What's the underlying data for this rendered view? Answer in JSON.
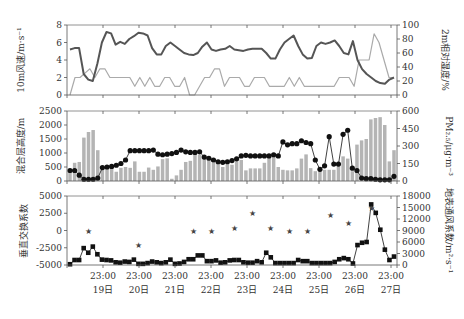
{
  "figure": {
    "caption": "",
    "x_ticks": [
      {
        "time": "23:00",
        "day": "19日"
      },
      {
        "time": "23:00",
        "day": "20日"
      },
      {
        "time": "23:00",
        "day": "21日"
      },
      {
        "time": "23:00",
        "day": "22日"
      },
      {
        "time": "23:00",
        "day": "23日"
      },
      {
        "time": "23:00",
        "day": "24日"
      },
      {
        "time": "23:00",
        "day": "25日"
      },
      {
        "time": "23:00",
        "day": "26日"
      },
      {
        "time": "23:00",
        "day": "27日"
      }
    ],
    "colors": {
      "dark_line": "#555555",
      "light_line": "#aaaaaa",
      "bars": "#b4b4b4",
      "markers": "#111111",
      "stars": "#444444"
    }
  },
  "chart_data": [
    {
      "type": "line",
      "panel": "top",
      "title": "",
      "ylabel": "10m风速/m·s⁻¹",
      "ylabel_right": "2m相对湿度/%",
      "ylim": [
        0,
        8
      ],
      "yticks": [
        0,
        2,
        4,
        6,
        8
      ],
      "ylim_right": [
        0,
        100
      ],
      "yticks_right": [
        0,
        20,
        40,
        60,
        80,
        100
      ],
      "x_interval_hours": 6,
      "series": [
        {
          "name": "10m风速",
          "axis": "left",
          "style": "light",
          "values": [
            0,
            2,
            2,
            2.5,
            3,
            2,
            3,
            3,
            2,
            2,
            2,
            2,
            2,
            1,
            2,
            1,
            2,
            1,
            1,
            2,
            2,
            1,
            1,
            2,
            0,
            0,
            1,
            2,
            2,
            3,
            3,
            1,
            2,
            2,
            2,
            1,
            1,
            2,
            2,
            2,
            1,
            1,
            1,
            1,
            2,
            1,
            2,
            1,
            1,
            1,
            1,
            1,
            1,
            1,
            2,
            2,
            2,
            1,
            4,
            4,
            4,
            7,
            6,
            4,
            2,
            2
          ]
        },
        {
          "name": "2m相对湿度",
          "axis": "right",
          "style": "dark",
          "values": [
            65,
            67,
            67,
            30,
            22,
            20,
            45,
            75,
            90,
            88,
            72,
            76,
            73,
            80,
            84,
            89,
            88,
            85,
            67,
            58,
            58,
            70,
            75,
            70,
            65,
            60,
            58,
            57,
            60,
            69,
            75,
            65,
            63,
            65,
            66,
            70,
            65,
            64,
            63,
            65,
            66,
            66,
            66,
            60,
            52,
            52,
            65,
            75,
            80,
            85,
            70,
            58,
            52,
            53,
            70,
            75,
            73,
            75,
            78,
            70,
            60,
            58,
            77,
            50,
            37,
            30,
            25,
            20,
            17,
            16,
            22,
            25
          ]
        }
      ]
    },
    {
      "type": "bar+line",
      "panel": "middle",
      "ylabel": "混合层高度/m",
      "ylabel_right": "PM₂.₅/μg·m⁻³",
      "ylim": [
        0,
        2500
      ],
      "yticks": [
        0,
        500,
        1000,
        1500,
        2000,
        2500
      ],
      "ylim_right": [
        0,
        600
      ],
      "yticks_right": [
        0,
        150,
        300,
        450,
        600
      ],
      "series": [
        {
          "name": "混合层高度",
          "axis": "left",
          "style": "bar",
          "values": [
            300,
            650,
            680,
            1550,
            1750,
            1820,
            1100,
            450,
            450,
            500,
            330,
            470,
            500,
            470,
            700,
            330,
            330,
            480,
            400,
            520,
            780,
            810,
            80,
            200,
            400,
            680,
            720,
            980,
            930,
            800,
            720,
            650,
            620,
            500,
            600,
            580,
            700,
            750,
            380,
            450,
            450,
            450,
            650,
            820,
            900,
            500,
            400,
            380,
            380,
            450,
            800,
            950,
            460,
            350,
            400,
            400,
            400,
            400,
            620,
            880,
            800,
            350,
            1300,
            1450,
            1500,
            2200,
            2250,
            2280,
            2000,
            700,
            1100
          ]
        },
        {
          "name": "PM2.5",
          "axis": "right",
          "style": "line-dot",
          "values": [
            90,
            90,
            50,
            15,
            15,
            15,
            25,
            115,
            120,
            125,
            135,
            150,
            180,
            260,
            260,
            260,
            260,
            260,
            265,
            230,
            225,
            230,
            235,
            245,
            265,
            250,
            245,
            245,
            250,
            205,
            195,
            180,
            165,
            160,
            165,
            175,
            190,
            215,
            220,
            215,
            215,
            215,
            215,
            215,
            225,
            215,
            335,
            310,
            320,
            320,
            345,
            330,
            320,
            180,
            100,
            130,
            380,
            145,
            145,
            400,
            435,
            110,
            90,
            25,
            20,
            20,
            15,
            10,
            10,
            10,
            40
          ]
        }
      ]
    },
    {
      "type": "line+scatter",
      "panel": "bottom",
      "ylabel": "垂直交换系数",
      "ylabel_right": "地表通风系数/m²·s⁻¹",
      "ylim": [
        -5000,
        5000
      ],
      "yticks": [
        -5000,
        -2500,
        0,
        2500,
        5000
      ],
      "ylim_right": [
        0,
        18000
      ],
      "yticks_right": [
        0,
        3000,
        6000,
        9000,
        12000,
        15000,
        18000
      ],
      "series": [
        {
          "name": "地表通风系数",
          "axis": "right",
          "style": "line-square",
          "values": [
            200,
            1300,
            1300,
            4400,
            3200,
            4800,
            2800,
            1400,
            1300,
            1200,
            700,
            600,
            900,
            800,
            1400,
            300,
            300,
            500,
            900,
            700,
            500,
            700,
            1400,
            300,
            400,
            800,
            1500,
            1500,
            2500,
            2500,
            1000,
            1000,
            1200,
            600,
            700,
            1200,
            1300,
            1300,
            700,
            600,
            600,
            1000,
            700,
            3200,
            2000,
            500,
            500,
            500,
            500,
            500,
            1300,
            1000,
            1000,
            500,
            500,
            500,
            500,
            500,
            800,
            1500,
            1800,
            1500,
            400,
            5200,
            5800,
            6000,
            15800,
            13600,
            9200,
            4000,
            1300,
            2200
          ]
        },
        {
          "name": "垂直交换系数",
          "axis": "left",
          "style": "star",
          "x_indices": [
            4,
            15,
            27,
            31,
            36,
            40,
            44,
            48,
            52,
            57,
            61,
            66
          ],
          "values": [
            0,
            -2100,
            0,
            0,
            400,
            2600,
            400,
            0,
            0,
            2300,
            1100,
            3200
          ]
        }
      ]
    }
  ]
}
